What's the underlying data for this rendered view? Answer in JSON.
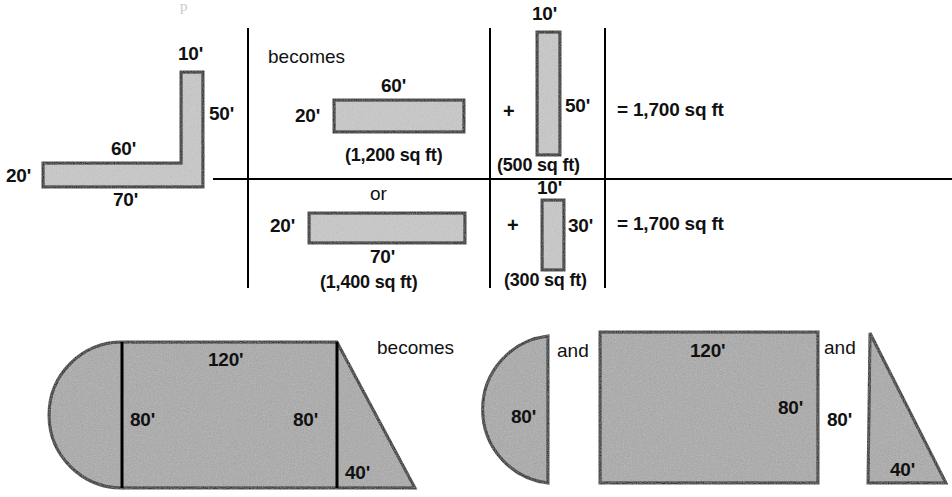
{
  "diagram": {
    "title_fragment": "p",
    "colors": {
      "fill_light": "#c9c9c9",
      "fill_dark": "#a9a9a9",
      "stroke": "#000000",
      "background": "#ffffff",
      "divider": "#000000"
    },
    "top_section": {
      "original_shape": {
        "name": "L-shaped lot",
        "labels": {
          "top_arm_width": "10'",
          "right_height": "50'",
          "inner_horizontal": "60'",
          "left_height": "20'",
          "bottom_width": "70'"
        }
      },
      "connector_word": "becomes",
      "alternative_word": "or",
      "option_a": {
        "rect_main": {
          "length_label": "60'",
          "height_label": "20'",
          "area_label": "(1,200 sq ft)"
        },
        "operator": "+",
        "rect_second": {
          "width_label": "10'",
          "height_label": "50'",
          "area_label": "(500 sq ft)"
        },
        "total": "= 1,700 sq ft"
      },
      "option_b": {
        "rect_main": {
          "length_label": "70'",
          "height_label": "20'",
          "area_label": "(1,400 sq ft)"
        },
        "operator": "+",
        "rect_second": {
          "width_label": "10'",
          "height_label": "30'",
          "area_label": "(300 sq ft)"
        },
        "total": "= 1,700 sq ft"
      }
    },
    "bottom_section": {
      "original_shape": {
        "name": "semicircle-rectangle-triangle composite lot",
        "labels": {
          "top_length": "120'",
          "left_height": "80'",
          "right_height": "80'",
          "triangle_base": "40'"
        }
      },
      "connector_word": "becomes",
      "and_word_1": "and",
      "and_word_2": "and",
      "part_semicircle": {
        "diameter_label": "80'"
      },
      "part_rectangle": {
        "length_label": "120'",
        "height_label": "80'"
      },
      "part_triangle": {
        "height_label": "80'",
        "base_label": "40'"
      }
    }
  }
}
